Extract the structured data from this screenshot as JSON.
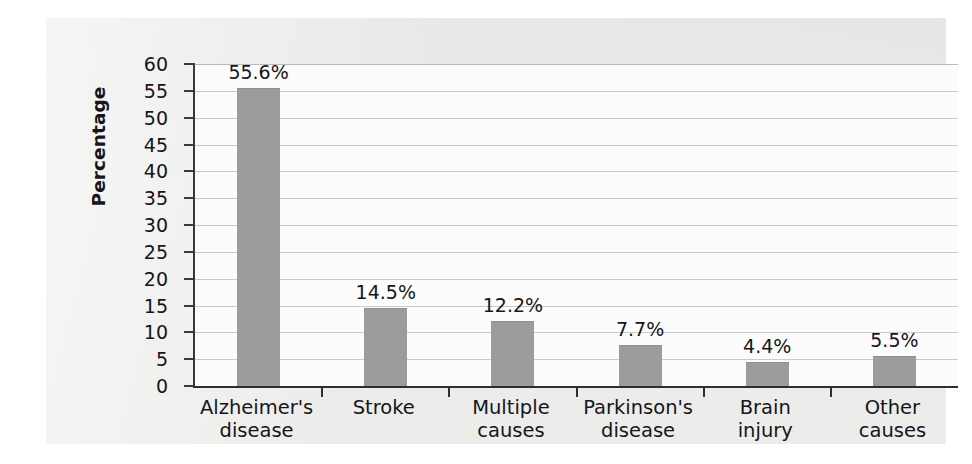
{
  "chart_data": {
    "type": "bar",
    "title": "",
    "xlabel": "",
    "ylabel": "Percentage",
    "categories": [
      "Alzheimer's\ndisease",
      "Stroke",
      "Multiple\ncauses",
      "Parkinson's\ndisease",
      "Brain\ninjury",
      "Other\ncauses"
    ],
    "values": [
      55.6,
      14.5,
      12.2,
      7.7,
      4.4,
      5.5
    ],
    "value_labels": [
      "55.6%",
      "14.5%",
      "12.2%",
      "7.7%",
      "4.4%",
      "5.5%"
    ],
    "ylim": [
      0,
      60
    ],
    "ytick_labels": [
      "0",
      "5",
      "10",
      "15",
      "20",
      "25",
      "30",
      "35",
      "40",
      "45",
      "50",
      "55",
      "60"
    ],
    "ytick_values": [
      0,
      5,
      10,
      15,
      20,
      25,
      30,
      35,
      40,
      45,
      50,
      55,
      60
    ],
    "grid": "horizontal",
    "legend": "none",
    "bar_color": "#9b9d9c",
    "gridline_color": "#c9cbcb",
    "axis_color": "#2e2e2e",
    "text_color": "#15161a",
    "plot_background": "#fcfcfc",
    "figure_background": "#ececeb"
  }
}
